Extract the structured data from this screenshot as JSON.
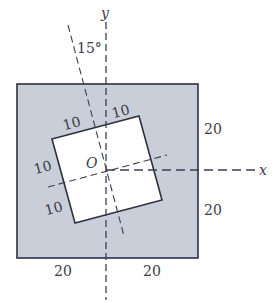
{
  "diagram": {
    "type": "plate-with-rotated-square-hole",
    "colors": {
      "plate_fill": "#c9ced8",
      "hole_fill": "#ffffff",
      "stroke": "#2e3140",
      "axis": "#3b3f55"
    },
    "axes": {
      "x_label": "x",
      "y_label": "y",
      "origin_label": "O"
    },
    "rotation_angle_label": "15°",
    "hole_dimensions": {
      "top_left_half": "10",
      "top_right_half": "10",
      "left_upper_half": "10",
      "left_lower_half": "10"
    },
    "plate_dimensions": {
      "right_upper": "20",
      "right_lower": "20",
      "bottom_left": "20",
      "bottom_right": "20"
    }
  }
}
